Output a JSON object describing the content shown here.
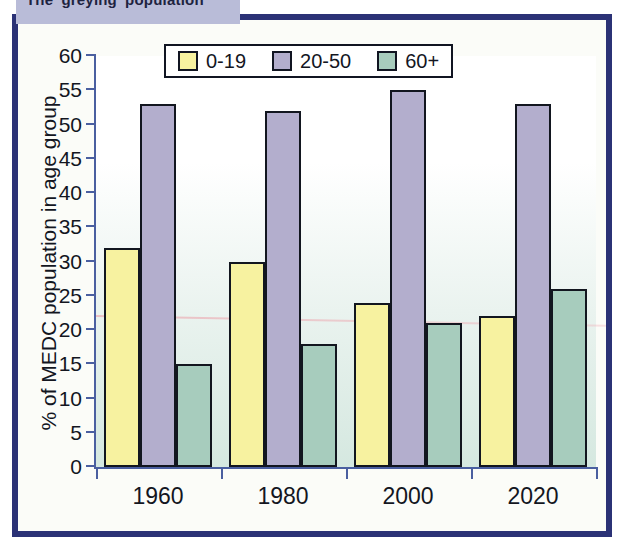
{
  "title_bar": {
    "text": "The 'greying' population",
    "background": "#b9bcd8"
  },
  "frame": {
    "border_color": "#2b3276"
  },
  "chart_data": {
    "type": "bar",
    "title": "The 'greying' population",
    "xlabel": "",
    "ylabel": "% of MEDC population in age group",
    "categories": [
      "1960",
      "1980",
      "2000",
      "2020"
    ],
    "series": [
      {
        "name": "0-19",
        "color": "#f7f2a0",
        "values": [
          32,
          30,
          24,
          22
        ]
      },
      {
        "name": "20-50",
        "color": "#b3aecd",
        "values": [
          53,
          52,
          55,
          53
        ]
      },
      {
        "name": "60+",
        "color": "#a7ccbd",
        "values": [
          15,
          18,
          21,
          26
        ]
      }
    ],
    "ylim": [
      0,
      60
    ],
    "ytick_step": 5,
    "yticks": [
      0,
      5,
      10,
      15,
      20,
      25,
      30,
      35,
      40,
      45,
      50,
      55,
      60
    ],
    "grid": false,
    "legend_position": "top-center"
  }
}
